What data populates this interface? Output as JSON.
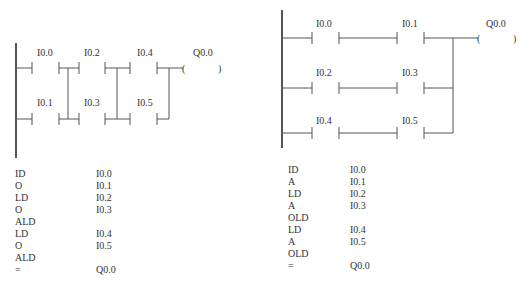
{
  "left": {
    "title": "ALD ladder example",
    "labels": {
      "c1": "I0.0",
      "c2": "I0.1",
      "c3": "I0.2",
      "c4": "I0.3",
      "c5": "I0.4",
      "c6": "I0.5",
      "coil": "Q0.0"
    },
    "instructions": [
      {
        "op": "ID",
        "arg": "I0.0"
      },
      {
        "op": "O",
        "arg": "I0.1"
      },
      {
        "op": "LD",
        "arg": "I0.2"
      },
      {
        "op": "O",
        "arg": "I0.3"
      },
      {
        "op": "ALD",
        "arg": ""
      },
      {
        "op": "LD",
        "arg": "I0.4"
      },
      {
        "op": "O",
        "arg": "I0.5"
      },
      {
        "op": "ALD",
        "arg": ""
      },
      {
        "op": "=",
        "arg": "Q0.0"
      }
    ]
  },
  "right": {
    "title": "OLD ladder example",
    "labels": {
      "c1": "I0.0",
      "c2": "I0.1",
      "c3": "I0.2",
      "c4": "I0.3",
      "c5": "I0.4",
      "c6": "I0.5",
      "coil": "Q0.0"
    },
    "instructions": [
      {
        "op": "ID",
        "arg": "I0.0"
      },
      {
        "op": "A",
        "arg": "I0.1"
      },
      {
        "op": "LD",
        "arg": "I0.2"
      },
      {
        "op": "A",
        "arg": "I0.3"
      },
      {
        "op": "OLD",
        "arg": ""
      },
      {
        "op": "LD",
        "arg": "I0.4"
      },
      {
        "op": "A",
        "arg": "I0.5"
      },
      {
        "op": "OLD",
        "arg": ""
      },
      {
        "op": "=",
        "arg": "Q0.0"
      }
    ]
  },
  "colors": {
    "line": "#555555",
    "text": "#333333",
    "background": "#ffffff"
  }
}
